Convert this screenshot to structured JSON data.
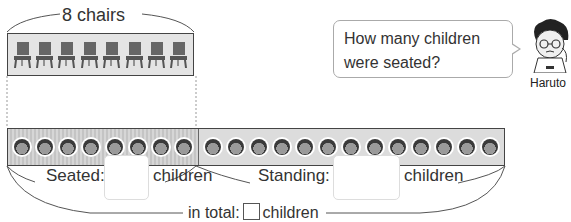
{
  "chairs": {
    "label": "8 chairs",
    "count": 8
  },
  "children_strip": {
    "seated_count_shown": 8,
    "standing_count_shown": 13
  },
  "speech_bubble": {
    "line1": "How many children",
    "line2": "were seated?"
  },
  "character": {
    "name": "Haruto"
  },
  "seated": {
    "label": "Seated:",
    "answer": "",
    "unit": "children"
  },
  "standing": {
    "label": "Standing:",
    "answer": "",
    "unit": "children"
  },
  "total": {
    "label": "in total:",
    "answer": "",
    "unit": "children"
  },
  "colors": {
    "outline": "#444444",
    "box_fill": "#e4e4e4",
    "text": "#333333"
  }
}
